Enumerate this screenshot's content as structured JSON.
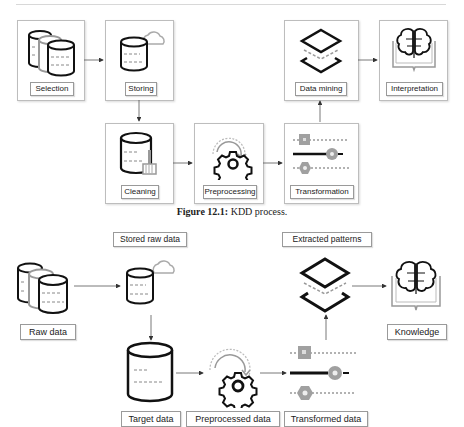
{
  "figure1": {
    "caption_label": "Figure 12.1:",
    "caption_text": " KDD process.",
    "steps": [
      {
        "label": "Selection",
        "icon": "database-stack-icon"
      },
      {
        "label": "Storing",
        "icon": "cloud-database-icon"
      },
      {
        "label": "Cleaning",
        "icon": "database-broom-icon"
      },
      {
        "label": "Preprocessing",
        "icon": "gear-refresh-icon"
      },
      {
        "label": "Transformation",
        "icon": "transform-sliders-icon"
      },
      {
        "label": "Data mining",
        "icon": "layers-icon"
      },
      {
        "label": "Interpretation",
        "icon": "brain-book-icon"
      }
    ]
  },
  "figure2": {
    "nodes": [
      {
        "label": "Raw data",
        "icon": "database-stack-icon"
      },
      {
        "label": "Stored raw data",
        "icon": "cloud-database-icon"
      },
      {
        "label": "Target data",
        "icon": "database-icon"
      },
      {
        "label": "Preprocessed data",
        "icon": "gear-refresh-icon"
      },
      {
        "label": "Transformed data",
        "icon": "transform-sliders-icon"
      },
      {
        "label": "Extracted patterns",
        "icon": "layers-icon"
      },
      {
        "label": "Knowledge",
        "icon": "brain-book-icon"
      }
    ]
  },
  "colors": {
    "stroke": "#111111",
    "dash": "#9a9a9a",
    "gray_shape": "#a0a0a0",
    "box_border": "#bdbdbd"
  }
}
